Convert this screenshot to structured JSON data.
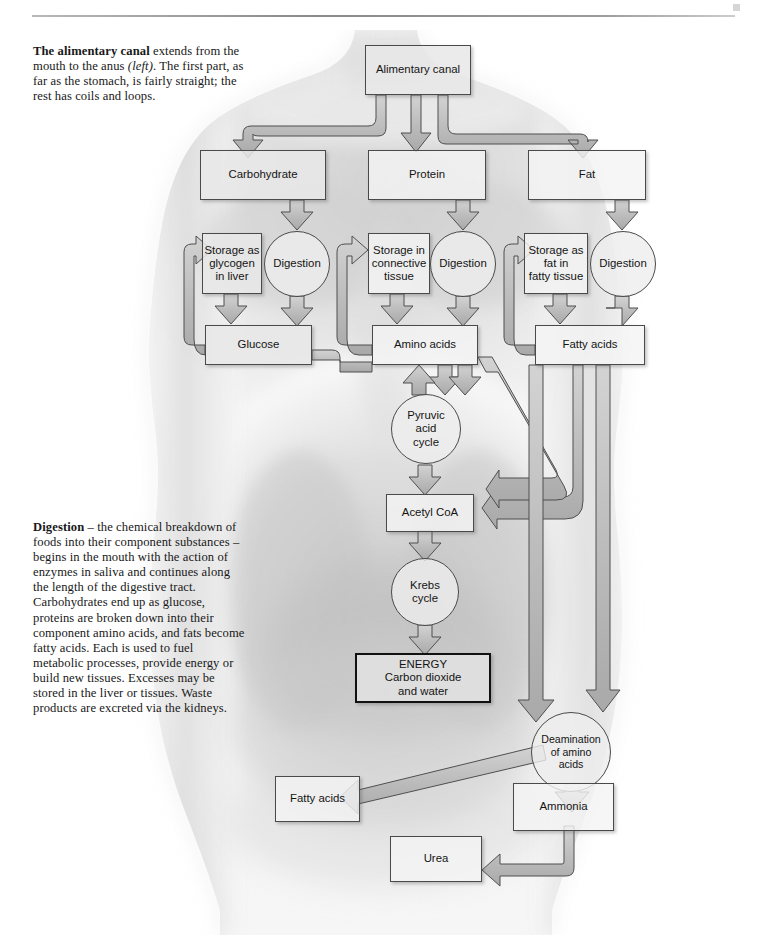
{
  "page": {
    "background_color": "#ffffff",
    "rule_color": "#8a8a8a",
    "box_fill": "#e8e8e8",
    "box_stroke": "#4a4a4a",
    "arrow_fill": "#bfbfbf",
    "arrow_stroke": "#4f4f4f"
  },
  "captions": {
    "alimentary": {
      "lead": "The alimentary canal",
      "body_1": " extends from the mouth to the anus ",
      "italic": "(left)",
      "body_2": ". The first part, as far as the stomach, is fairly straight; the rest has coils and loops."
    },
    "digestion": {
      "lead": "Digestion",
      "body": " – the chemical breakdown of foods into their component substances – begins in the mouth with the action of enzymes in saliva and continues along the length of the digestive tract. Carbohydrates end up as glucose, proteins are broken down into their component amino acids, and fats become fatty acids. Each is used to fuel metabolic processes, provide energy or build new tissues. Excesses may be stored in the liver or tissues. Waste products are excreted via the kidneys."
    }
  },
  "diagram": {
    "nodes": {
      "alimentary_canal": "Alimentary canal",
      "carbohydrate": "Carbohydrate",
      "protein": "Protein",
      "fat": "Fat",
      "storage_glycogen_l1": "Storage as",
      "storage_glycogen_l2": "glycogen",
      "storage_glycogen_l3": "in liver",
      "storage_connective_l1": "Storage in",
      "storage_connective_l2": "connective",
      "storage_connective_l3": "tissue",
      "storage_fat_l1": "Storage as",
      "storage_fat_l2": "fat in",
      "storage_fat_l3": "fatty tissue",
      "digestion_1": "Digestion",
      "digestion_2": "Digestion",
      "digestion_3": "Digestion",
      "glucose": "Glucose",
      "amino_acids": "Amino acids",
      "fatty_acids": "Fatty acids",
      "pyruvic_l1": "Pyruvic",
      "pyruvic_l2": "acid",
      "pyruvic_l3": "cycle",
      "acetyl_coa": "Acetyl CoA",
      "krebs_l1": "Krebs",
      "krebs_l2": "cycle",
      "energy_l1": "ENERGY",
      "energy_l2": "Carbon dioxide",
      "energy_l3": "and water",
      "deamination_l1": "Deamination",
      "deamination_l2": "of amino",
      "deamination_l3": "acids",
      "ammonia": "Ammonia",
      "urea": "Urea",
      "fatty_acids_out": "Fatty acids"
    },
    "flows": [
      "Alimentary canal → Carbohydrate",
      "Alimentary canal → Protein",
      "Alimentary canal → Fat",
      "Carbohydrate → Digestion",
      "Protein → Digestion",
      "Fat → Digestion",
      "Digestion → Glucose",
      "Digestion → Amino acids",
      "Digestion → Fatty acids",
      "Storage as glycogen in liver → Glucose",
      "Glucose → Storage as glycogen in liver",
      "Storage in connective tissue → Amino acids",
      "Amino acids → Storage in connective tissue",
      "Storage as fat in fatty tissue → Fatty acids",
      "Fatty acids → Storage as fat in fatty tissue",
      "Glucose → Pyruvic acid cycle",
      "Amino acids → Pyruvic acid cycle",
      "Pyruvic acid cycle → Amino acids",
      "Pyruvic acid cycle → Acetyl CoA",
      "Fatty acids → Acetyl CoA",
      "Acetyl CoA → Krebs cycle",
      "Krebs cycle → ENERGY Carbon dioxide and water",
      "Amino acids → Deamination of amino acids",
      "Deamination of amino acids → Ammonia",
      "Deamination of amino acids → Fatty acids",
      "Ammonia → Urea"
    ]
  }
}
